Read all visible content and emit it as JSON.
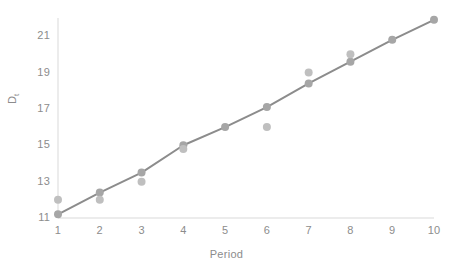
{
  "chart_data": {
    "type": "scatter",
    "title": "",
    "xlabel": "Period",
    "ylabel": "D",
    "ylabel_subscript": "t",
    "ylabel_full": "Dt",
    "x": [
      1,
      2,
      3,
      4,
      5,
      6,
      7,
      8,
      9,
      10
    ],
    "xlim": [
      1,
      10
    ],
    "ylim": [
      11,
      22
    ],
    "xticks": [
      1,
      2,
      3,
      4,
      5,
      6,
      7,
      8,
      9,
      10
    ],
    "xtick_labels": [
      "1",
      "2",
      "3",
      "4",
      "5",
      "6",
      "7",
      "8",
      "9",
      "10"
    ],
    "yticks": [
      11,
      13,
      15,
      17,
      19,
      21
    ],
    "ytick_labels": [
      "11",
      "13",
      "15",
      "17",
      "19",
      "21"
    ],
    "grid": false,
    "legend": "none",
    "series": [
      {
        "name": "Actual",
        "type": "scatter",
        "marker": "circle",
        "color": "#bfbfbf",
        "x": [
          1,
          2,
          3,
          4,
          6,
          7,
          8
        ],
        "values": [
          12.0,
          12.0,
          13.0,
          14.8,
          16.0,
          19.0,
          20.0
        ]
      },
      {
        "name": "Fitted trend",
        "type": "line",
        "marker": "circle",
        "color": "#a6a6a6",
        "line_color": "#8c8c8c",
        "x": [
          1,
          2,
          3,
          4,
          5,
          6,
          7,
          8,
          9,
          10
        ],
        "values": [
          11.2,
          12.4,
          13.5,
          15.0,
          16.0,
          17.1,
          18.4,
          19.6,
          20.8,
          21.9
        ]
      }
    ],
    "colors": {
      "marker": "#bfbfbf",
      "line": "#8c8c8c",
      "axis": "#d9d9d9",
      "text": "#8c8c8c",
      "background": "#ffffff"
    }
  }
}
